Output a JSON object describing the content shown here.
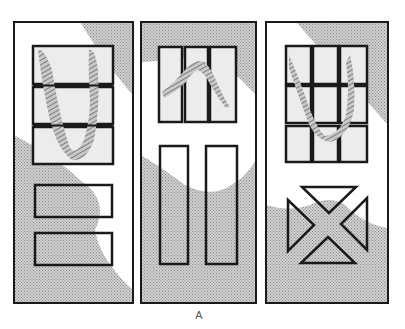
{
  "figure": {
    "label": "A",
    "colors": {
      "outline": "#1a1a1a",
      "shade": "#b8b8b8",
      "glass": "#ececec",
      "hatch": "#7a7a7a",
      "background": "#ffffff"
    },
    "doors": [
      {
        "name": "door-1",
        "glass_panels": 3,
        "glass_layout": "3 horizontal lites stacked",
        "lower_panels": 2,
        "lower_layout": "2 horizontal raised panels"
      },
      {
        "name": "door-2",
        "glass_panels": 3,
        "glass_layout": "3 vertical lites side by side",
        "lower_panels": 2,
        "lower_layout": "2 tall vertical raised panels"
      },
      {
        "name": "door-3",
        "glass_panels": 9,
        "glass_layout": "3x3 grid of lites",
        "lower_panels": 4,
        "lower_layout": "4 triangles forming an X pattern"
      }
    ]
  }
}
